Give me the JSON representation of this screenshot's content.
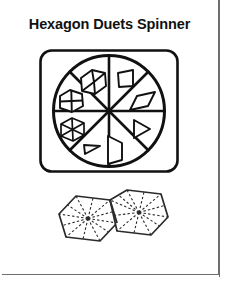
{
  "page": {
    "title": "Hexagon Duets Spinner",
    "background_color": "#ffffff",
    "ink_color": "#111111",
    "frame_color": "#6e6e6e"
  },
  "spinner": {
    "name": "hexagon-duets-spinner",
    "frame_shape": "rounded-square",
    "sector_count": 8,
    "sectors": [
      {
        "index": 1,
        "position": "top-left",
        "shape_name": "cube-hexagon",
        "description": "hexagon drawn as 3D cube with three rhombus faces"
      },
      {
        "index": 2,
        "position": "left-upper",
        "shape_name": "hexagon-with-cross",
        "description": "hexagon divided by internal cross lines"
      },
      {
        "index": 3,
        "position": "left-lower",
        "shape_name": "hexagon-six-spokes",
        "description": "hexagon divided into six triangles by spokes"
      },
      {
        "index": 4,
        "position": "bottom-left",
        "shape_name": "small-triangle",
        "description": "small right triangle pointing left"
      },
      {
        "index": 5,
        "position": "bottom-right",
        "shape_name": "tall-trapezoid",
        "description": "tall trapezoid opening right"
      },
      {
        "index": 6,
        "position": "right-lower",
        "shape_name": "triangle-right",
        "description": "triangle pointing right"
      },
      {
        "index": 7,
        "position": "right-upper",
        "shape_name": "rhombus",
        "description": "slanted rhombus / parallelogram"
      },
      {
        "index": 8,
        "position": "top-right",
        "shape_name": "small-trapezoid",
        "description": "small trapezoid"
      }
    ]
  },
  "hexagon_duet": {
    "name": "hexagon-duet-diagram",
    "hexagon_count": 2,
    "arrangement": "two adjoining hexagons sharing one edge",
    "spokes_per_hexagon": 12,
    "line_style": "dashed",
    "hexagons": [
      {
        "index": 1,
        "label": "left-hexagon"
      },
      {
        "index": 2,
        "label": "right-hexagon"
      }
    ]
  }
}
